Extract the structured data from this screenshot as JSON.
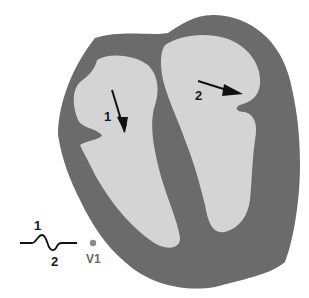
{
  "diagram": {
    "type": "heart cross-section with depolarization vectors",
    "colors": {
      "myocardium": "#6b6b6b",
      "chamber": "#d4d4d4",
      "background": "#ffffff",
      "arrow": "#111111",
      "electrode": "#8a8a8a"
    },
    "vectors": [
      {
        "id": "1",
        "label": "1",
        "direction": "downward (septal, left chamber)"
      },
      {
        "id": "2",
        "label": "2",
        "direction": "rightward (right chamber)"
      }
    ],
    "waveform": {
      "label_up": "1",
      "label_down": "2"
    },
    "lead": {
      "label": "V1"
    }
  }
}
